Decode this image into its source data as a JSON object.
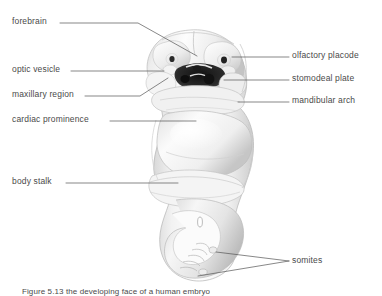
{
  "figure": {
    "background_color": "#ffffff",
    "leader_color": "#555555",
    "text_color": "#4a4a4a",
    "caption_prefix": "Figure 5.13",
    "caption_text": "Figure 5.13  the developing face of a human embryo"
  },
  "labels_left": [
    {
      "id": "forebrain",
      "text": "forebrain",
      "x": 12,
      "y": 20
    },
    {
      "id": "optic-vesicle",
      "text": "optic vesicle",
      "x": 12,
      "y": 68
    },
    {
      "id": "maxillary-region",
      "text": "maxillary region",
      "x": 12,
      "y": 93
    },
    {
      "id": "cardiac-prominence",
      "text": "cardiac prominence",
      "x": 12,
      "y": 118
    },
    {
      "id": "body-stalk",
      "text": "body stalk",
      "x": 12,
      "y": 180
    }
  ],
  "labels_right": [
    {
      "id": "olfactory-placode",
      "text": "olfactory placode",
      "x": 292,
      "y": 54
    },
    {
      "id": "stomodeal-plate",
      "text": "stomodeal plate",
      "x": 292,
      "y": 77
    },
    {
      "id": "mandibular-arch",
      "text": "mandibular arch",
      "x": 292,
      "y": 99
    },
    {
      "id": "somites",
      "text": "somites",
      "x": 292,
      "y": 259
    }
  ],
  "anatomy_structures": [
    "forebrain",
    "optic vesicle",
    "maxillary region",
    "cardiac prominence",
    "body stalk",
    "olfactory placode",
    "stomodeal plate",
    "mandibular arch",
    "somites"
  ]
}
